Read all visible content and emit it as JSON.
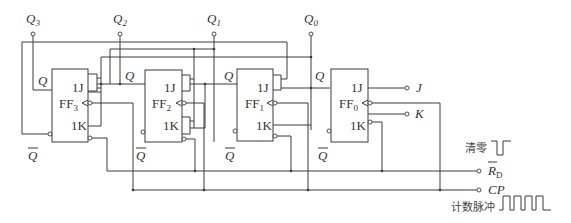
{
  "outputs": [
    {
      "label": "Q",
      "sub": "3"
    },
    {
      "label": "Q",
      "sub": "2"
    },
    {
      "label": "Q",
      "sub": "1"
    },
    {
      "label": "Q",
      "sub": "0"
    }
  ],
  "flipflops": [
    {
      "name": "FF",
      "sub": "3",
      "j": "1J",
      "k": "1K",
      "q": "Q",
      "qbar": "Q"
    },
    {
      "name": "FF",
      "sub": "2",
      "j": "1J",
      "k": "1K",
      "q": "Q",
      "qbar": "Q"
    },
    {
      "name": "FF",
      "sub": "1",
      "j": "1J",
      "k": "1K",
      "q": "Q",
      "qbar": "Q"
    },
    {
      "name": "FF",
      "sub": "0",
      "j": "1J",
      "k": "1K",
      "q": "Q",
      "qbar": "Q"
    }
  ],
  "inputs": {
    "j": "J",
    "k": "K",
    "rd": "R",
    "rd_sub": "D",
    "cp": "CP"
  },
  "annotations": {
    "clear": "清零",
    "count_pulse": "计数脉冲"
  }
}
